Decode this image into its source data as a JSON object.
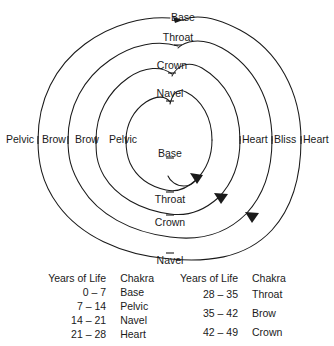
{
  "figure": {
    "type": "spiral-chakra-diagram",
    "stroke_color": "#1a1a1a",
    "background_color": "#ffffff",
    "spiral_labels": {
      "top": [
        "Base",
        "Throat",
        "Crown",
        "Navel"
      ],
      "left": [
        "Pelvic",
        "Brow",
        "Brow",
        "Pelvic"
      ],
      "right": [
        "Heart",
        "Bliss",
        "Heart"
      ],
      "bottom": [
        "Throat",
        "Crown",
        "Navel"
      ],
      "center": "Base"
    },
    "labels": [
      {
        "text": "Base",
        "x": 183,
        "y": 12,
        "align": "center"
      },
      {
        "text": "Throat",
        "x": 178,
        "y": 40,
        "align": "center"
      },
      {
        "text": "Crown",
        "x": 172,
        "y": 68,
        "align": "center"
      },
      {
        "text": "Navel",
        "x": 170,
        "y": 96,
        "align": "center"
      },
      {
        "text": "Pelvic",
        "x": 8,
        "y": 138,
        "align": "left"
      },
      {
        "text": "Brow",
        "x": 44,
        "y": 138,
        "align": "left"
      },
      {
        "text": "Brow",
        "x": 77,
        "y": 138,
        "align": "left"
      },
      {
        "text": "Pelvic",
        "x": 111,
        "y": 138,
        "align": "left"
      },
      {
        "text": "Base",
        "x": 168,
        "y": 152,
        "align": "center"
      },
      {
        "text": "Heart",
        "x": 238,
        "y": 138,
        "align": "left"
      },
      {
        "text": "Bliss",
        "x": 272,
        "y": 138,
        "align": "left"
      },
      {
        "text": "Heart",
        "x": 305,
        "y": 138,
        "align": "left"
      },
      {
        "text": "Throat",
        "x": 170,
        "y": 198,
        "align": "center"
      },
      {
        "text": "Crown",
        "x": 170,
        "y": 221,
        "align": "center"
      },
      {
        "text": "Navel",
        "x": 170,
        "y": 250,
        "align": "center"
      }
    ]
  },
  "tables": [
    {
      "name": "table-left",
      "headers": {
        "years": "Years of Life",
        "chakra": "Chakra"
      },
      "rows": [
        {
          "years": "0 – 7",
          "chakra": "Base"
        },
        {
          "years": "7 – 14",
          "chakra": "Pelvic"
        },
        {
          "years": "14 – 21",
          "chakra": "Navel"
        },
        {
          "years": "21 – 28",
          "chakra": "Heart"
        }
      ]
    },
    {
      "name": "table-right",
      "headers": {
        "years": "Years of Life",
        "chakra": "Chakra"
      },
      "rows": [
        {
          "years": "28 – 35",
          "chakra": "Throat"
        },
        {
          "years": "35 – 42",
          "chakra": "Brow"
        },
        {
          "years": "42 – 49",
          "chakra": "Crown"
        }
      ]
    }
  ]
}
